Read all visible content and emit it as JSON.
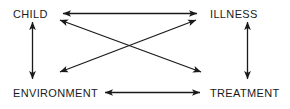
{
  "diagram": {
    "type": "relationship-diagram",
    "stroke_color": "#1a1a1a",
    "background_color": "#ffffff",
    "nodes": [
      {
        "id": "child",
        "label": "CHILD",
        "position": "top-left"
      },
      {
        "id": "illness",
        "label": "ILLNESS",
        "position": "top-right"
      },
      {
        "id": "environment",
        "label": "ENVIRONMENT",
        "position": "bottom-left"
      },
      {
        "id": "treatment",
        "label": "TREATMENT",
        "position": "bottom-right"
      }
    ],
    "edges": [
      {
        "id": "child-illness",
        "from": "child",
        "to": "illness",
        "style": "double-arrow",
        "orientation": "horizontal-top"
      },
      {
        "id": "environment-treatment",
        "from": "environment",
        "to": "treatment",
        "style": "double-arrow",
        "orientation": "horizontal-bottom"
      },
      {
        "id": "child-environment",
        "from": "child",
        "to": "environment",
        "style": "double-arrow",
        "orientation": "vertical-left"
      },
      {
        "id": "illness-treatment",
        "from": "illness",
        "to": "treatment",
        "style": "double-arrow",
        "orientation": "vertical-right"
      },
      {
        "id": "child-treatment",
        "from": "child",
        "to": "treatment",
        "style": "double-arrow",
        "orientation": "diagonal-descending"
      },
      {
        "id": "illness-environment",
        "from": "illness",
        "to": "environment",
        "style": "double-arrow",
        "orientation": "diagonal-ascending"
      }
    ]
  }
}
